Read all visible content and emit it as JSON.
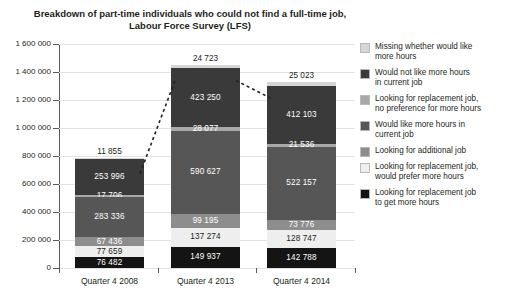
{
  "chart_data": {
    "type": "bar",
    "subtype": "stacked-column",
    "title": "Breakdown of part-time individuals who could not find a full-time job,",
    "subtitle": "Labour Force Survey (LFS)",
    "xlabel": "",
    "ylabel": "",
    "categories": [
      "Quarter 4 2008",
      "Quarter 4 2013",
      "Quarter 4 2014"
    ],
    "ylim": [
      0,
      1600000
    ],
    "ytick_step": 200000,
    "ytick_labels": [
      "0",
      "200 000",
      "400 000",
      "600 000",
      "800 000",
      "1 000 000",
      "1 200 000",
      "1 400 000",
      "1 600 000"
    ],
    "grid": true,
    "legend_position": "right",
    "series": [
      {
        "name": "Looking for replacement job to get more hours",
        "color": "#141414",
        "text_color": "#ffffff",
        "values": [
          76482,
          149937,
          142788
        ],
        "labels": [
          "76 482",
          "149 937",
          "142 788"
        ]
      },
      {
        "name": "Looking for replacement job, would prefer more hours",
        "color": "#eeeeee",
        "text_color": "#231f20",
        "values": [
          77659,
          137274,
          128747
        ],
        "labels": [
          "77 659",
          "137 274",
          "128 747"
        ]
      },
      {
        "name": "Looking for additional job",
        "color": "#8d8d8d",
        "text_color": "#ffffff",
        "values": [
          67436,
          99195,
          73776
        ],
        "labels": [
          "67 436",
          "99 195",
          "73 776"
        ]
      },
      {
        "name": "Would like more hours in current job",
        "color": "#565656",
        "text_color": "#ffffff",
        "values": [
          283336,
          590627,
          522157
        ],
        "labels": [
          "283 336",
          "590 627",
          "522 157"
        ]
      },
      {
        "name": "Looking for replacement job, no preference for more hours",
        "color": "#a8a8a8",
        "text_color": "#ffffff",
        "values": [
          17706,
          28077,
          21536
        ],
        "labels": [
          "17 706",
          "28 077",
          "21 536"
        ]
      },
      {
        "name": "Would not like more hours in current job",
        "color": "#3a3a3a",
        "text_color": "#ffffff",
        "values": [
          253996,
          423250,
          412103
        ],
        "labels": [
          "253 996",
          "423 250",
          "412 103"
        ]
      },
      {
        "name": "Missing whether would like more hours",
        "color": "#d6d6d6",
        "text_color": "#231f20",
        "values": [
          11855,
          24723,
          25023
        ],
        "labels": [
          "11 855",
          "24 723",
          "25 023"
        ],
        "label_outside": true
      }
    ],
    "legend_order": [
      "Missing whether would like more hours",
      "Would not like more hours in current job",
      "Looking for replacement job, no preference for more hours",
      "Would like more hours in current job",
      "Looking for additional job",
      "Looking for replacement job, would prefer more hours",
      "Looking for replacement job to get more hours"
    ],
    "legend": [
      {
        "label_line1": "Missing whether would like",
        "label_line2": "more hours",
        "color": "#d6d6d6"
      },
      {
        "label_line1": "Would not like more hours",
        "label_line2": "in current job",
        "color": "#3a3a3a"
      },
      {
        "label_line1": "Looking for replacement job,",
        "label_line2": "no preference for more hours",
        "color": "#a8a8a8"
      },
      {
        "label_line1": "Would like more hours in",
        "label_line2": "current job",
        "color": "#565656"
      },
      {
        "label_line1": "Looking for additional job",
        "label_line2": "",
        "color": "#8d8d8d"
      },
      {
        "label_line1": "Looking for replacement job,",
        "label_line2": "would prefer more hours",
        "color": "#eeeeee"
      },
      {
        "label_line1": "Looking for replacement job",
        "label_line2": "to get more hours",
        "color": "#141414"
      }
    ],
    "totals": [
      788510,
      1453083,
      1326130
    ],
    "annotations": {
      "connector_style": "dashed",
      "connector_color": "#231f20"
    }
  }
}
